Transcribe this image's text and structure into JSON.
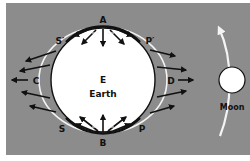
{
  "diagram": {
    "type": "tidal-forces",
    "colors": {
      "background": "#ffffff",
      "panel": "#8c8c8c",
      "earth_fill": "#ffffff",
      "outline": "#111111",
      "bulge": "#f4f4f4",
      "arrow": "#111111",
      "moon_fill": "#ffffff",
      "orbit_arrow": "#f4f4f4"
    },
    "labels": {
      "a": "A",
      "b": "B",
      "c": "C",
      "d": "D",
      "s_prime": "S′",
      "p_prime": "P′",
      "s": "S",
      "p": "P",
      "e": "E",
      "earth": "Earth",
      "moon": "Moon"
    }
  }
}
